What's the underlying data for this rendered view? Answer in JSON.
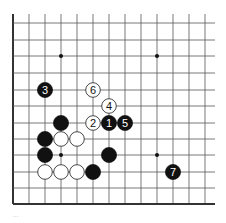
{
  "diagram": {
    "type": "go-board-partial",
    "columns_x": [
      13,
      29,
      45,
      61,
      77,
      93,
      109,
      125,
      141,
      157,
      173,
      189,
      205
    ],
    "rows_y": [
      23,
      40,
      56,
      73,
      90,
      106,
      123,
      139,
      155,
      172,
      188,
      204
    ],
    "grid_extent": {
      "left": 13,
      "right": 215,
      "top": 14,
      "bottom": 204
    },
    "edges": [
      "left",
      "bottom"
    ],
    "colors": {
      "line": "#555555",
      "edge": "#333333",
      "black_stone": "#111111",
      "white_stone": "#ffffff",
      "white_outline": "#333333"
    },
    "hoshi": [
      {
        "col": 3,
        "row": 2
      },
      {
        "col": 9,
        "row": 2
      },
      {
        "col": 3,
        "row": 8
      },
      {
        "col": 9,
        "row": 8
      }
    ],
    "stones": [
      {
        "color": "black",
        "col": 6,
        "row": 6,
        "label": "1"
      },
      {
        "color": "white",
        "col": 5,
        "row": 6,
        "label": "2"
      },
      {
        "color": "black",
        "col": 2,
        "row": 4,
        "label": "3"
      },
      {
        "color": "white",
        "col": 6,
        "row": 5,
        "label": "4"
      },
      {
        "color": "black",
        "col": 7,
        "row": 6,
        "label": "5"
      },
      {
        "color": "white",
        "col": 5,
        "row": 4,
        "label": "6"
      },
      {
        "color": "black",
        "col": 10,
        "row": 9,
        "label": "7"
      },
      {
        "color": "black",
        "col": 3,
        "row": 6,
        "label": ""
      },
      {
        "color": "black",
        "col": 2,
        "row": 7,
        "label": ""
      },
      {
        "color": "white",
        "col": 3,
        "row": 7,
        "label": ""
      },
      {
        "color": "white",
        "col": 4,
        "row": 7,
        "label": ""
      },
      {
        "color": "black",
        "col": 2,
        "row": 8,
        "label": ""
      },
      {
        "color": "black",
        "col": 6,
        "row": 8,
        "label": ""
      },
      {
        "color": "white",
        "col": 2,
        "row": 9,
        "label": ""
      },
      {
        "color": "white",
        "col": 3,
        "row": 9,
        "label": ""
      },
      {
        "color": "white",
        "col": 4,
        "row": 9,
        "label": ""
      },
      {
        "color": "black",
        "col": 5,
        "row": 9,
        "label": ""
      }
    ]
  },
  "caption": {
    "text": "…"
  }
}
